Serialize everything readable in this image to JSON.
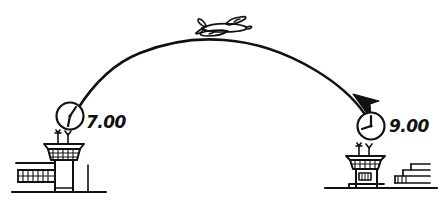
{
  "diagram": {
    "background_color": "#ffffff",
    "ink_color": "#111111",
    "style": "hand-drawn sketch"
  },
  "departure": {
    "label": "7.00",
    "clock_name": "departure-clock",
    "airport_name": "departure-airport",
    "tower_label": "control-tower",
    "terminal_label": "terminal-building",
    "ground_label": "ground-line"
  },
  "arrival": {
    "label": "9.00",
    "clock_name": "arrival-clock",
    "airport_name": "arrival-airport",
    "tower_label": "control-tower",
    "terminal_label": "terminal-building",
    "ground_label": "ground-line"
  },
  "flight": {
    "path_name": "flight-path-arc",
    "arrow_name": "arrowhead",
    "aircraft_name": "airplane-icon",
    "direction": "left-to-right"
  }
}
